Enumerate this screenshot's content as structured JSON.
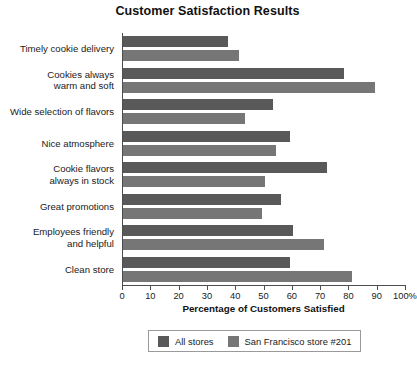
{
  "chart_data": {
    "type": "bar",
    "orientation": "horizontal",
    "title": "Customer Satisfaction Results",
    "xlabel": "Percentage of Customers Satisfied",
    "ylabel": "",
    "xlim": [
      0,
      100
    ],
    "xticks": [
      0,
      10,
      20,
      30,
      40,
      50,
      60,
      70,
      80,
      90,
      100
    ],
    "xtick_labels": [
      "0",
      "10",
      "20",
      "30",
      "40",
      "50",
      "60",
      "70",
      "80",
      "90",
      "100%"
    ],
    "grid": false,
    "legend_position": "bottom",
    "categories": [
      "Timely cookie delivery",
      "Cookies always warm and soft",
      "Wide selection of flavors",
      "Nice atmosphere",
      "Cookie flavors always in stock",
      "Great promotions",
      "Employees friendly and helpful",
      "Clean store"
    ],
    "category_lines": [
      [
        "Timely cookie delivery"
      ],
      [
        "Cookies always",
        "warm and soft"
      ],
      [
        "Wide selection of flavors"
      ],
      [
        "Nice atmosphere"
      ],
      [
        "Cookie flavors",
        "always in stock"
      ],
      [
        "Great promotions"
      ],
      [
        "Employees friendly",
        "and helpful"
      ],
      [
        "Clean store"
      ]
    ],
    "series": [
      {
        "name": "All stores",
        "color": "#595959",
        "values": [
          37,
          78,
          53,
          59,
          72,
          56,
          60,
          59
        ]
      },
      {
        "name": "San Francisco store #201",
        "color": "#767676",
        "values": [
          41,
          89,
          43,
          54,
          50,
          49,
          71,
          81
        ]
      }
    ]
  },
  "legend": {
    "items": [
      {
        "label": "All stores"
      },
      {
        "label": "San Francisco store #201"
      }
    ]
  }
}
